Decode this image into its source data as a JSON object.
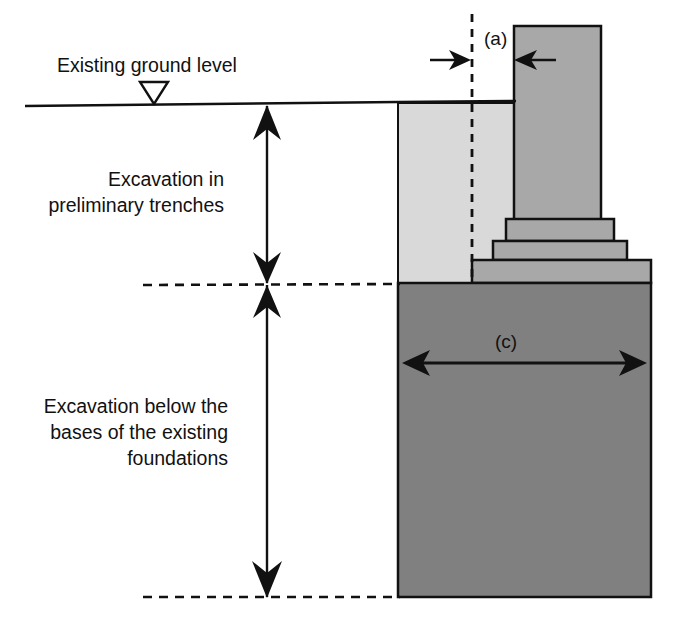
{
  "figure": {
    "background_color": "#ffffff",
    "line_color": "#111111",
    "width": 673,
    "height": 637
  },
  "labels": {
    "ground_level": "Existing ground level",
    "preliminary_line1": "Excavation in",
    "preliminary_line2": "preliminary trenches",
    "below_line1": "Excavation below the",
    "below_line2": "bases of the existing",
    "below_line3": "foundations",
    "dim_a": "(a)",
    "dim_c": "(c)"
  },
  "colors": {
    "trench_fill": "#d9d9d9",
    "footing_fill": "#a8a8a8",
    "column_fill": "#a8a8a8",
    "deep_excavation_fill": "#808080",
    "outline": "#111111",
    "text": "#111111"
  },
  "geometry": {
    "ground_line_y": 103,
    "ground_line_x_start": 25,
    "ground_line_x_end": 520,
    "trench_base_y": 283,
    "excavation_base_y": 597,
    "trench_left_x": 398,
    "body_right_x": 651,
    "dashed_vertical_x": 472,
    "dimension_line_x": 267,
    "column": {
      "x": 514,
      "y": 26,
      "w": 87,
      "h": 193
    },
    "steps": [
      {
        "x": 506,
        "y": 219,
        "w": 108,
        "h": 22
      },
      {
        "x": 493,
        "y": 241,
        "w": 134,
        "h": 19
      },
      {
        "x": 472,
        "y": 260,
        "w": 179,
        "h": 23
      }
    ],
    "deep_block": {
      "x": 398,
      "y": 283,
      "w": 253,
      "h": 314
    },
    "dim_c_y": 360,
    "dim_c_x_start": 404,
    "dim_c_x_end": 645,
    "dim_a_arrow_y": 60
  }
}
